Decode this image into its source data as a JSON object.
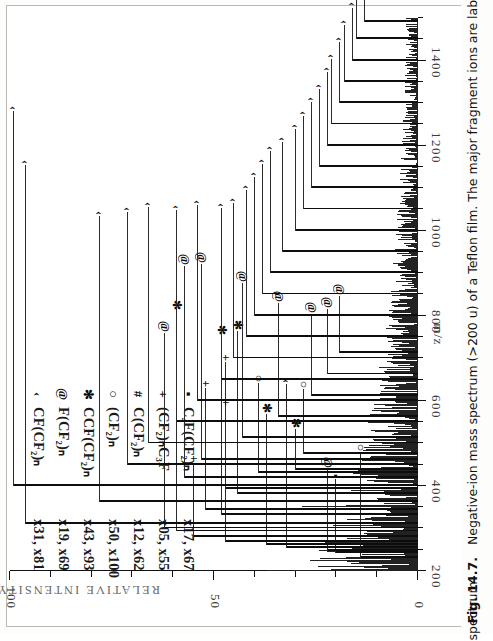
{
  "figure": {
    "number": "Fig. 14.7.",
    "caption_line1": "Negative-ion mass spectrum (>200 u) of a Teflon film. The major fragment ions are labeled on the mass",
    "caption_line2": "spectrum"
  },
  "legend": {
    "entries": [
      {
        "symbol": "‹",
        "symbol_name": "caret-marker",
        "formula": "CF(CF₂)ₙ",
        "multipliers": "x31, x81"
      },
      {
        "symbol": "@",
        "symbol_name": "at-marker",
        "formula": "F(CF₂)ₙ",
        "multipliers": "x19, x69"
      },
      {
        "symbol": "✻",
        "symbol_name": "asterisk-marker",
        "formula": "CCF(CF₂)ₙ",
        "multipliers": "x43, x93"
      },
      {
        "symbol": "○",
        "symbol_name": "circle-marker",
        "formula": "(CF₂)ₙ",
        "multipliers": "x50, x100"
      },
      {
        "symbol": "#",
        "symbol_name": "hash-marker",
        "formula": "C(CF₂)ₙ",
        "multipliers": "x12, x62"
      },
      {
        "symbol": "+",
        "symbol_name": "plus-marker",
        "formula": "(CF₂)ₙC₃F",
        "multipliers": "x05, x55"
      },
      {
        "symbol": "▪",
        "symbol_name": "square-marker",
        "formula": "C₄F(CF₂)ₙ",
        "multipliers": "x17, x67"
      }
    ]
  },
  "chart_data": {
    "type": "line",
    "title": "Negative-ion mass spectrum (>200 u) of a Teflon film",
    "xlabel": "m/z",
    "ylabel": "RELATIVE INTENSITY",
    "xlim": [
      200,
      1500
    ],
    "ylim": [
      0,
      100
    ],
    "xticks_major": [
      200,
      400,
      600,
      800,
      1000,
      1200,
      1400
    ],
    "xticks_major_labels": [
      "200",
      "400",
      "600",
      "800",
      "1000",
      "1200",
      "1400"
    ],
    "xtick_minor_step": 50,
    "yticks_major": [
      0,
      50,
      100
    ],
    "yticks_major_labels": [
      "0",
      "50",
      "100"
    ],
    "ytick_minor_step": 10,
    "grid": false,
    "legend_position": "upper-left",
    "labeled_peaks": [
      {
        "mz": 231,
        "intensity": 14,
        "symbol": "○",
        "leader": 26
      },
      {
        "mz": 243,
        "intensity": 20,
        "symbol": "▪",
        "leader": 18
      },
      {
        "mz": 247,
        "intensity": 22,
        "symbol": "@",
        "leader": 20
      },
      {
        "mz": 255,
        "intensity": 32,
        "symbol": "‹",
        "leader": 40
      },
      {
        "mz": 262,
        "intensity": 37,
        "symbol": "✻",
        "leader": 32
      },
      {
        "mz": 269,
        "intensity": 47,
        "symbol": "+",
        "leader": 44
      },
      {
        "mz": 281,
        "intensity": 55,
        "symbol": "+",
        "leader": 18
      },
      {
        "mz": 293,
        "intensity": 59,
        "symbol": "✻",
        "leader": 54
      },
      {
        "mz": 300,
        "intensity": 62,
        "symbol": "@",
        "leader": 48
      },
      {
        "mz": 310,
        "intensity": 96,
        "symbol": "‹",
        "leader": 88
      },
      {
        "mz": 331,
        "intensity": 48,
        "symbol": "✻",
        "leader": 44
      },
      {
        "mz": 343,
        "intensity": 52,
        "symbol": "+",
        "leader": 30
      },
      {
        "mz": 362,
        "intensity": 78,
        "symbol": "‹",
        "leader": 70
      },
      {
        "mz": 381,
        "intensity": 44,
        "symbol": "✻",
        "leader": 40
      },
      {
        "mz": 393,
        "intensity": 47,
        "symbol": "+",
        "leader": 20
      },
      {
        "mz": 400,
        "intensity": 99,
        "symbol": "‹",
        "leader": 92
      },
      {
        "mz": 418,
        "intensity": 57,
        "symbol": "@",
        "leader": 52
      },
      {
        "mz": 431,
        "intensity": 39,
        "symbol": "○",
        "leader": 22
      },
      {
        "mz": 437,
        "intensity": 30,
        "symbol": "✻",
        "leader": 10
      },
      {
        "mz": 450,
        "intensity": 71,
        "symbol": "‹",
        "leader": 62
      },
      {
        "mz": 462,
        "intensity": 53,
        "symbol": "@",
        "leader": 48
      },
      {
        "mz": 475,
        "intensity": 28,
        "symbol": "○",
        "leader": 16
      },
      {
        "mz": 500,
        "intensity": 66,
        "symbol": "‹",
        "leader": 58
      },
      {
        "mz": 512,
        "intensity": 43,
        "symbol": "@",
        "leader": 38
      },
      {
        "mz": 550,
        "intensity": 59,
        "symbol": "‹",
        "leader": 52
      },
      {
        "mz": 562,
        "intensity": 34,
        "symbol": "@",
        "leader": 28
      },
      {
        "mz": 600,
        "intensity": 54,
        "symbol": "‹",
        "leader": 48
      },
      {
        "mz": 612,
        "intensity": 26,
        "symbol": "@",
        "leader": 20
      },
      {
        "mz": 650,
        "intensity": 48,
        "symbol": "‹",
        "leader": 42
      },
      {
        "mz": 662,
        "intensity": 22,
        "symbol": "@",
        "leader": 16
      },
      {
        "mz": 700,
        "intensity": 45,
        "symbol": "‹",
        "leader": 38
      },
      {
        "mz": 712,
        "intensity": 19,
        "symbol": "@",
        "leader": 14
      },
      {
        "mz": 750,
        "intensity": 42,
        "symbol": "‹",
        "leader": 36
      },
      {
        "mz": 800,
        "intensity": 40,
        "symbol": "‹",
        "leader": 34
      },
      {
        "mz": 850,
        "intensity": 38,
        "symbol": "‹",
        "leader": 32
      },
      {
        "mz": 900,
        "intensity": 36,
        "symbol": "‹",
        "leader": 30
      },
      {
        "mz": 950,
        "intensity": 33,
        "symbol": "‹",
        "leader": 27
      },
      {
        "mz": 1000,
        "intensity": 30,
        "symbol": "‹",
        "leader": 25
      },
      {
        "mz": 1050,
        "intensity": 28,
        "symbol": "‹",
        "leader": 23
      },
      {
        "mz": 1100,
        "intensity": 26,
        "symbol": "‹",
        "leader": 21
      },
      {
        "mz": 1150,
        "intensity": 24,
        "symbol": "‹",
        "leader": 19
      },
      {
        "mz": 1200,
        "intensity": 22,
        "symbol": "‹",
        "leader": 18
      },
      {
        "mz": 1250,
        "intensity": 21,
        "symbol": "‹",
        "leader": 16
      },
      {
        "mz": 1300,
        "intensity": 19,
        "symbol": "‹",
        "leader": 15
      },
      {
        "mz": 1350,
        "intensity": 18,
        "symbol": "‹",
        "leader": 14
      },
      {
        "mz": 1400,
        "intensity": 16,
        "symbol": "‹",
        "leader": 13
      },
      {
        "mz": 1450,
        "intensity": 15,
        "symbol": "‹",
        "leader": 12
      },
      {
        "mz": 1490,
        "intensity": 13,
        "symbol": "‹",
        "leader": 11
      }
    ]
  }
}
